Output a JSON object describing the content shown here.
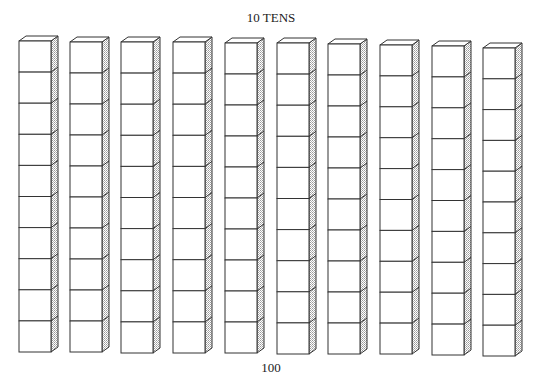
{
  "title": "10 TENS",
  "total_label": "100",
  "rods": {
    "count": 10,
    "cubes_per_rod": 10,
    "positions": [
      {
        "x": 19,
        "top": 36,
        "bottom": 352
      },
      {
        "x": 70,
        "top": 37,
        "bottom": 352
      },
      {
        "x": 121,
        "top": 37,
        "bottom": 353
      },
      {
        "x": 173,
        "top": 37,
        "bottom": 353
      },
      {
        "x": 225,
        "top": 38,
        "bottom": 353
      },
      {
        "x": 277,
        "top": 38,
        "bottom": 354
      },
      {
        "x": 328,
        "top": 39,
        "bottom": 354
      },
      {
        "x": 380,
        "top": 40,
        "bottom": 354
      },
      {
        "x": 432,
        "top": 41,
        "bottom": 355
      },
      {
        "x": 483,
        "top": 43,
        "bottom": 356
      }
    ],
    "front_width": 32,
    "depth": 7,
    "stroke_color": "#333333",
    "side_shade_color": "#bdbdbd"
  }
}
